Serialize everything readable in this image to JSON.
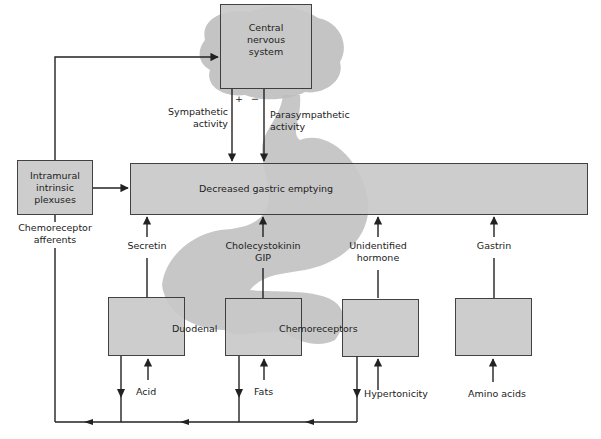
{
  "diagram": {
    "type": "flow-diagram",
    "topic": "Regulation of gastric emptying",
    "nodes": {
      "cns": {
        "label_lines": [
          "Central",
          "nervous",
          "system"
        ]
      },
      "plexuses": {
        "label_lines": [
          "Intramural",
          "intrinsic",
          "plexuses"
        ]
      },
      "main": {
        "label": "Decreased gastric emptying"
      },
      "duodenal_chemoreceptors": {
        "label_left": "Duodenal",
        "label_right": "Chemoreceptors"
      }
    },
    "edges": {
      "sympathetic": {
        "label_lines": [
          "Sympathetic",
          "activity"
        ],
        "sign": "+"
      },
      "parasympathetic": {
        "label_lines": [
          "Parasympathetic",
          "activity"
        ],
        "sign": "−"
      },
      "chemoreceptor_afferents": {
        "label_lines": [
          "Chemoreceptor",
          "afferents"
        ]
      },
      "secretin": {
        "label": "Secretin"
      },
      "cck_gip": {
        "label_lines": [
          "Cholecystokinin",
          "GIP"
        ]
      },
      "unidentified": {
        "label_lines": [
          "Unidentified",
          "hormone"
        ]
      },
      "gastrin": {
        "label": "Gastrin"
      }
    },
    "stimuli": {
      "acid": "Acid",
      "fats": "Fats",
      "hypertonicity": "Hypertonicity",
      "amino_acids": "Amino acids"
    },
    "colors": {
      "box_fill": "#c9c9c9",
      "line": "#222222",
      "organ_shadow": "#bdbdbd"
    }
  }
}
